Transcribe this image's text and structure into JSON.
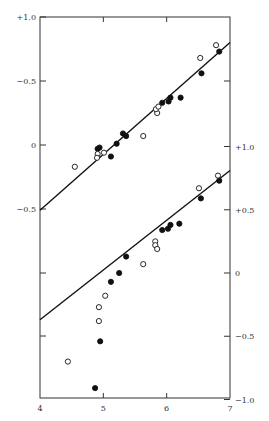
{
  "chart_data": {
    "type": "scatter",
    "title": "",
    "xlabel": "",
    "ylabel": "",
    "x_ticks": [
      4,
      5,
      6,
      7
    ],
    "xlim": [
      4,
      7
    ],
    "grid": false,
    "legend": null,
    "panels": [
      {
        "name": "upper",
        "axis": "left",
        "y_tick_labels": [
          "+1.0",
          "−0.5",
          "0",
          "−0.5"
        ],
        "y_tick_values": [
          1.0,
          0.5,
          0.0,
          -0.5
        ],
        "ylim": [
          -1.0,
          1.0
        ],
        "fit_line": {
          "x": [
            4.0,
            7.0
          ],
          "y": [
            -0.51,
            0.8
          ]
        },
        "series": [
          {
            "name": "filled",
            "marker": "filled-circle",
            "points": [
              [
                4.91,
                -0.03
              ],
              [
                4.94,
                -0.02
              ],
              [
                5.12,
                -0.09
              ],
              [
                5.21,
                0.01
              ],
              [
                5.31,
                0.09
              ],
              [
                5.36,
                0.07
              ],
              [
                5.93,
                0.33
              ],
              [
                6.03,
                0.34
              ],
              [
                6.06,
                0.37
              ],
              [
                6.22,
                0.37
              ],
              [
                6.55,
                0.56
              ],
              [
                6.83,
                0.73
              ]
            ]
          },
          {
            "name": "open",
            "marker": "open-circle",
            "points": [
              [
                4.55,
                -0.17
              ],
              [
                4.91,
                -0.07
              ],
              [
                4.9,
                -0.1
              ],
              [
                5.01,
                -0.06
              ],
              [
                5.63,
                0.07
              ],
              [
                5.85,
                0.25
              ],
              [
                5.83,
                0.28
              ],
              [
                5.87,
                0.3
              ],
              [
                6.53,
                0.68
              ],
              [
                6.78,
                0.78
              ]
            ]
          }
        ]
      },
      {
        "name": "lower",
        "axis": "right",
        "y_tick_labels": [
          "+1.0",
          "+0.5",
          "0",
          "−0.5",
          "−1.0"
        ],
        "y_tick_values": [
          1.0,
          0.5,
          0.0,
          -0.5,
          -1.0
        ],
        "ylim": [
          -1.0,
          1.0
        ],
        "fit_line": {
          "x": [
            4.0,
            7.0
          ],
          "y": [
            -0.37,
            0.81
          ]
        },
        "series": [
          {
            "name": "filled",
            "marker": "filled-circle",
            "points": [
              [
                4.87,
                -0.91
              ],
              [
                4.95,
                -0.54
              ],
              [
                5.12,
                -0.07
              ],
              [
                5.25,
                0.0
              ],
              [
                5.36,
                0.13
              ],
              [
                5.93,
                0.34
              ],
              [
                6.02,
                0.35
              ],
              [
                6.06,
                0.38
              ],
              [
                6.2,
                0.39
              ],
              [
                6.54,
                0.59
              ],
              [
                6.83,
                0.73
              ]
            ]
          },
          {
            "name": "open",
            "marker": "open-circle",
            "points": [
              [
                4.44,
                -0.7
              ],
              [
                4.93,
                -0.38
              ],
              [
                4.93,
                -0.27
              ],
              [
                5.03,
                -0.18
              ],
              [
                5.63,
                0.07
              ],
              [
                5.82,
                0.25
              ],
              [
                5.82,
                0.22
              ],
              [
                5.85,
                0.19
              ],
              [
                6.51,
                0.67
              ],
              [
                6.81,
                0.77
              ]
            ]
          }
        ]
      }
    ]
  },
  "axes": {
    "x_labels": [
      "4",
      "5",
      "6",
      "7"
    ],
    "left_labels": [
      "+1.0",
      "−0.5",
      "0",
      "−0.5"
    ],
    "right_labels": [
      "+1.0",
      "+0.5",
      "0",
      "−0.5",
      "−1.0"
    ]
  }
}
